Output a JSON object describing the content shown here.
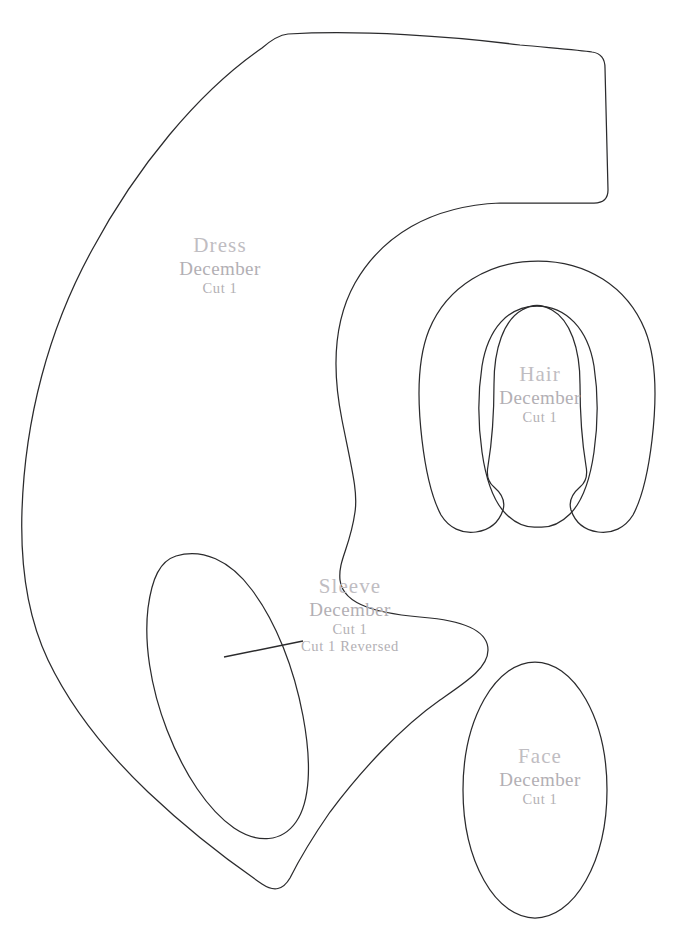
{
  "sheet": {
    "title": "Felt Doll Pattern Sheet",
    "background_color": "#ffffff",
    "outline_color": "#2b2b2d",
    "label_color": "#b3b0b5"
  },
  "pieces": [
    {
      "id": "dress",
      "name": "Dress",
      "month": "December",
      "cut": "Cut 1",
      "cut_reversed": ""
    },
    {
      "id": "hair",
      "name": "Hair",
      "month": "December",
      "cut": "Cut 1",
      "cut_reversed": ""
    },
    {
      "id": "sleeve",
      "name": "Sleeve",
      "month": "December",
      "cut": "Cut 1",
      "cut_reversed": "Cut 1 Reversed"
    },
    {
      "id": "face",
      "name": "Face",
      "month": "December",
      "cut": "Cut 1",
      "cut_reversed": ""
    }
  ]
}
